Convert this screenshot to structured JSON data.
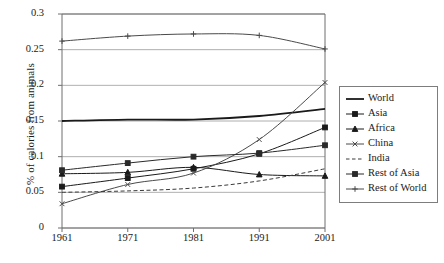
{
  "chart_data": {
    "type": "line",
    "title": "",
    "xlabel": "",
    "ylabel": "% of calories from animals",
    "x": [
      1961,
      1971,
      1981,
      1991,
      2001
    ],
    "categories": [
      "1961",
      "1971",
      "1981",
      "1991",
      "2001"
    ],
    "xtick_labels": [
      "1961",
      "1971",
      "1981",
      "1991",
      "2001"
    ],
    "ytick_labels": [
      "0.3",
      "0.25",
      "0.2",
      "0.15",
      "0.1",
      "0.05",
      "0"
    ],
    "ytick_values": [
      0.3,
      0.25,
      0.2,
      0.15,
      0.1,
      0.05,
      0
    ],
    "ylim": [
      0,
      0.3
    ],
    "xlim": [
      1961,
      2001
    ],
    "grid": "horizontal",
    "legend_position": "right",
    "series": [
      {
        "name": "World",
        "marker": "none",
        "linestyle": "solid",
        "linewidth": 1.8,
        "color": "#1a1a1a",
        "values": [
          0.15,
          0.152,
          0.152,
          0.157,
          0.167
        ]
      },
      {
        "name": "Asia",
        "marker": "square",
        "linestyle": "solid",
        "linewidth": 1.0,
        "color": "#1a1a1a",
        "values": [
          0.058,
          0.07,
          0.083,
          0.104,
          0.141
        ]
      },
      {
        "name": "Africa",
        "marker": "triangle",
        "linestyle": "solid",
        "linewidth": 1.0,
        "color": "#1a1a1a",
        "values": [
          0.076,
          0.078,
          0.085,
          0.075,
          0.073
        ]
      },
      {
        "name": "China",
        "marker": "cross",
        "linestyle": "solid",
        "linewidth": 1.0,
        "color": "#4a4a4a",
        "values": [
          0.034,
          0.061,
          0.077,
          0.124,
          0.204
        ]
      },
      {
        "name": "India",
        "marker": "none",
        "linestyle": "dashed",
        "linewidth": 1.0,
        "color": "#3a3a3a",
        "values": [
          0.05,
          0.052,
          0.056,
          0.066,
          0.083
        ]
      },
      {
        "name": "Rest of Asia",
        "marker": "square",
        "linestyle": "solid",
        "linewidth": 1.0,
        "color": "#2a2a2a",
        "values": [
          0.081,
          0.091,
          0.1,
          0.105,
          0.116
        ]
      },
      {
        "name": "Rest of World",
        "marker": "plus",
        "linestyle": "solid",
        "linewidth": 1.0,
        "color": "#4a4a4a",
        "values": [
          0.262,
          0.269,
          0.272,
          0.27,
          0.251
        ]
      }
    ]
  },
  "legend": {
    "items": [
      {
        "label": "World"
      },
      {
        "label": "Asia"
      },
      {
        "label": "Africa"
      },
      {
        "label": "China"
      },
      {
        "label": "India"
      },
      {
        "label": "Rest of Asia"
      },
      {
        "label": "Rest of World"
      }
    ]
  },
  "axes": {
    "y_title": "% of calories from animals"
  },
  "colors": {
    "axis": "#6e6e6e",
    "grid": "#9a9a9a",
    "text": "#1a1a1a",
    "background": "#ffffff"
  }
}
